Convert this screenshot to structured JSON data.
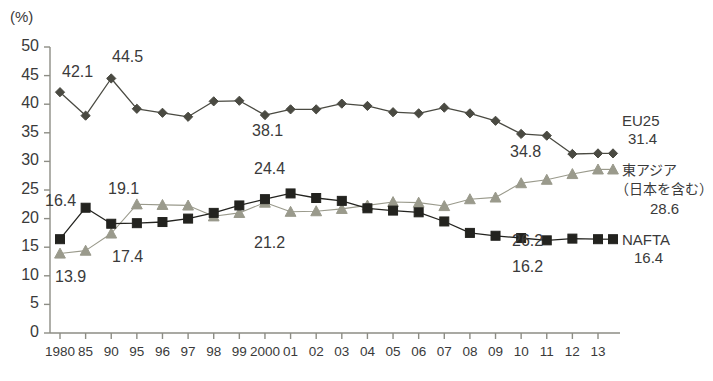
{
  "chart_data": {
    "type": "line",
    "title": "",
    "xlabel": "",
    "ylabel": "(%)",
    "ylim": [
      0,
      50
    ],
    "ytick_step": 5,
    "grid": false,
    "legend_position": "right",
    "categories": [
      "1980",
      "85",
      "90",
      "95",
      "96",
      "97",
      "98",
      "99",
      "2000",
      "01",
      "02",
      "03",
      "04",
      "05",
      "06",
      "07",
      "08",
      "09",
      "10",
      "11",
      "12",
      "13"
    ],
    "yticks": [
      "0",
      "5",
      "10",
      "15",
      "20",
      "25",
      "30",
      "35",
      "40",
      "45",
      "50"
    ],
    "series": [
      {
        "name": "EU25",
        "marker": "diamond",
        "color": "#4a4a42",
        "end_value": "31.4",
        "values": [
          42.1,
          38.0,
          44.5,
          39.2,
          38.5,
          37.8,
          40.5,
          40.6,
          38.1,
          39.1,
          39.1,
          40.1,
          39.7,
          38.6,
          38.4,
          39.4,
          38.4,
          37.1,
          34.8,
          34.5,
          31.3,
          31.4
        ]
      },
      {
        "name": "東アジア（日本を含む）",
        "marker": "triangle",
        "color": "#9a9a8c",
        "end_value": "28.6",
        "values": [
          13.9,
          14.4,
          17.4,
          22.5,
          22.4,
          22.3,
          20.4,
          21.0,
          22.8,
          21.2,
          21.3,
          21.7,
          22.3,
          22.9,
          22.8,
          22.2,
          23.4,
          23.7,
          26.2,
          26.8,
          27.8,
          28.6
        ]
      },
      {
        "name": "NAFTA",
        "marker": "square",
        "color": "#23231f",
        "end_value": "16.4",
        "values": [
          16.4,
          21.9,
          19.1,
          19.2,
          19.4,
          20.0,
          21.0,
          22.3,
          23.4,
          24.4,
          23.6,
          23.1,
          21.8,
          21.4,
          21.1,
          19.5,
          17.5,
          17.0,
          16.6,
          16.2,
          16.5,
          16.4
        ]
      }
    ],
    "annotations": [
      {
        "text": "42.1",
        "x": 62,
        "y": 63
      },
      {
        "text": "44.5",
        "x": 112,
        "y": 48
      },
      {
        "text": "38.1",
        "x": 252,
        "y": 122
      },
      {
        "text": "34.8",
        "x": 510,
        "y": 143
      },
      {
        "text": "24.4",
        "x": 254,
        "y": 160
      },
      {
        "text": "26.2",
        "x": 512,
        "y": 232
      },
      {
        "text": "21.2",
        "x": 254,
        "y": 234
      },
      {
        "text": "19.1",
        "x": 108,
        "y": 180
      },
      {
        "text": "16.4",
        "x": 45,
        "y": 192
      },
      {
        "text": "17.4",
        "x": 112,
        "y": 248
      },
      {
        "text": "13.9",
        "x": 55,
        "y": 268
      },
      {
        "text": "16.2",
        "x": 512,
        "y": 258
      }
    ]
  },
  "legend": {
    "eu25": {
      "name": "EU25",
      "value": "31.4"
    },
    "east_asia": {
      "line1": "東アジア",
      "line2": "（日本を含む）",
      "value": "28.6"
    },
    "nafta": {
      "name": "NAFTA",
      "value": "16.4"
    }
  },
  "axis": {
    "unit": "(%)"
  }
}
